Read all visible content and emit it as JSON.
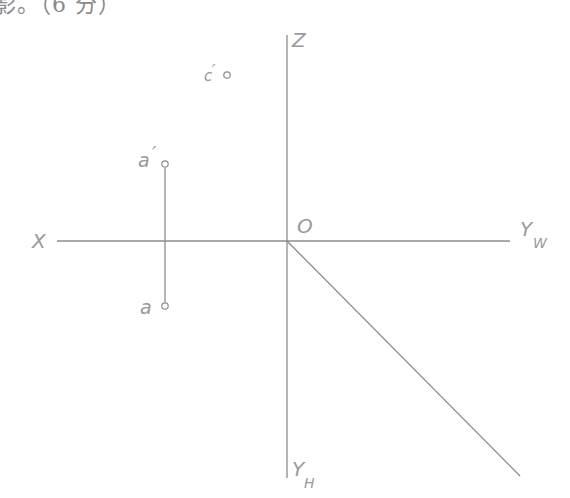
{
  "header": {
    "text": "影。（6 分）"
  },
  "diagram": {
    "axes": {
      "x_label": "X",
      "z_label": "Z",
      "origin_label": "O",
      "yw_label": "Y",
      "yw_sub": "W",
      "yh_label": "Y",
      "yh_sub": "H"
    },
    "points": [
      {
        "id": "a_prime",
        "label": "a",
        "mark": "′"
      },
      {
        "id": "a",
        "label": "a",
        "mark": ""
      },
      {
        "id": "c_prime",
        "label": "c",
        "mark": "′"
      }
    ],
    "colors": {
      "line": "#8c8c8c",
      "text": "#9a9a9a"
    }
  }
}
